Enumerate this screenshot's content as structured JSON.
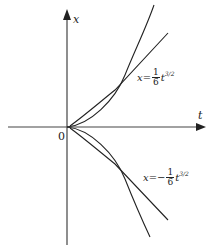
{
  "diagram": {
    "axes": {
      "horizontal_label": "t",
      "vertical_label": "x",
      "origin_label": "0"
    },
    "curves": [
      {
        "name": "upper",
        "equation": {
          "lhs": "x",
          "eq": "=",
          "sign": "",
          "numerator": "1",
          "denominator": "6",
          "variable": "t",
          "exponent": "3/2"
        }
      },
      {
        "name": "lower",
        "equation": {
          "lhs": "x",
          "eq": "=",
          "sign": "−",
          "numerator": "1",
          "denominator": "6",
          "variable": "t",
          "exponent": "3/2"
        }
      }
    ],
    "colors": {
      "line": "#222222",
      "axis": "#444444",
      "background": "#ffffff"
    }
  }
}
